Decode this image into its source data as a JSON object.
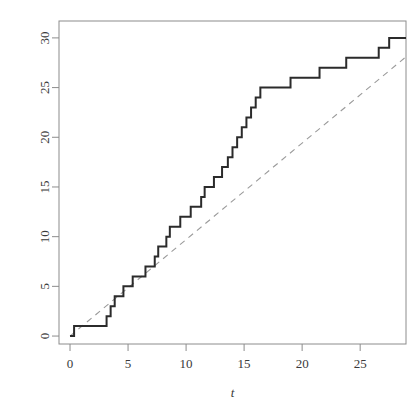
{
  "figure": {
    "cropped_title_remnant": "",
    "background_color": "#ffffff",
    "frame_color": "#8c8c8c"
  },
  "chart_data": {
    "type": "line",
    "title": "",
    "xlabel": "t",
    "ylabel": "",
    "xlim": [
      -0.95,
      28.95
    ],
    "ylim": [
      -0.8,
      31.7
    ],
    "xticks": [
      0,
      5,
      10,
      15,
      20,
      25
    ],
    "yticks": [
      0,
      5,
      10,
      15,
      20,
      25,
      30
    ],
    "xtick_labels": [
      "0",
      "5",
      "10",
      "15",
      "20",
      "25"
    ],
    "ytick_labels": [
      "0",
      "5",
      "10",
      "15",
      "20",
      "25",
      "30"
    ],
    "grid": false,
    "legend": null,
    "series": [
      {
        "name": "counting-process-step",
        "style": "step",
        "color": "#2b2b2b",
        "linewidth": 2.0,
        "dash": "solid",
        "jump_times": [
          0.35,
          3.15,
          3.5,
          3.85,
          4.6,
          5.4,
          6.5,
          7.3,
          7.6,
          8.3,
          8.6,
          9.5,
          10.4,
          11.3,
          11.6,
          12.4,
          13.1,
          13.6,
          14.0,
          14.4,
          14.8,
          15.2,
          15.6,
          16.0,
          16.4,
          19.0,
          21.5,
          23.8,
          26.6,
          27.5
        ],
        "counts": [
          1,
          2,
          3,
          4,
          5,
          6,
          7,
          8,
          9,
          10,
          11,
          12,
          13,
          14,
          15,
          16,
          17,
          18,
          19,
          20,
          21,
          22,
          23,
          24,
          25,
          26,
          27,
          28,
          29,
          30
        ],
        "start_point": [
          0,
          0
        ],
        "end_time": 28.95
      },
      {
        "name": "reference-diagonal",
        "style": "line",
        "color": "#9a9a9a",
        "linewidth": 1.1,
        "dash": "dashed",
        "x": [
          0,
          28.95
        ],
        "y": [
          0,
          28.1
        ]
      }
    ]
  }
}
